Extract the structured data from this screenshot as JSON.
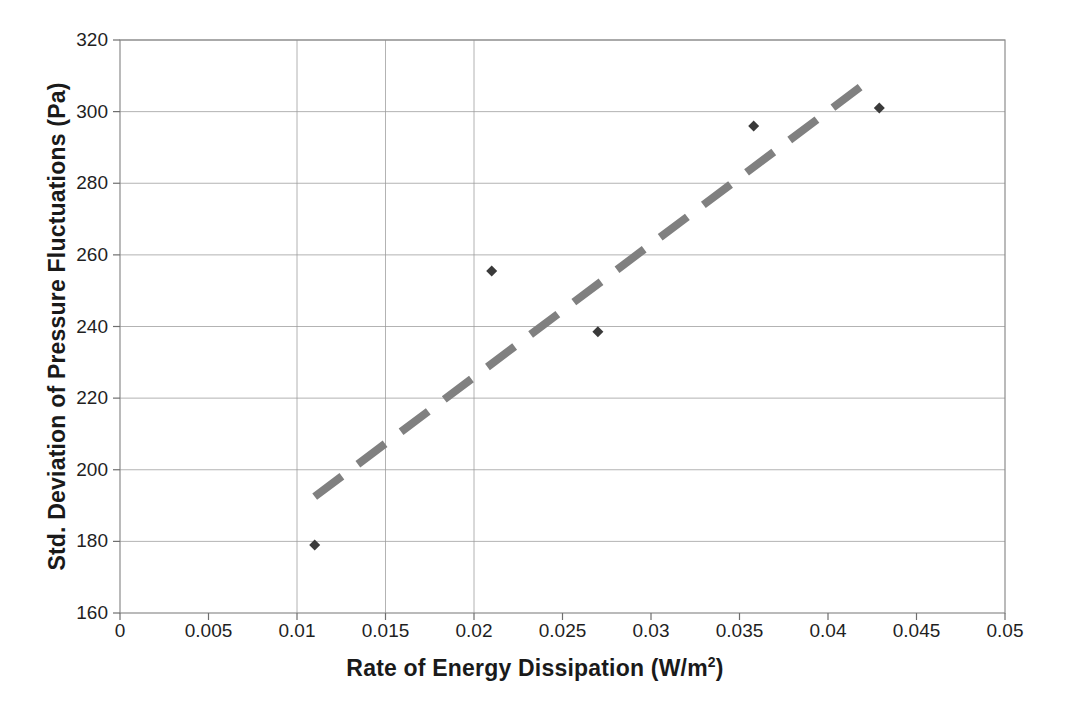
{
  "chart_data": {
    "type": "scatter",
    "title": "",
    "xlabel": "Rate of Energy Dissipation (W/m2)",
    "xlabel_base": "Rate of Energy Dissipation (W/m",
    "xlabel_sup": "2",
    "xlabel_tail": ")",
    "ylabel": "Std. Deviation of Pressure Fluctuations (Pa)",
    "xlim": [
      0,
      0.05
    ],
    "ylim": [
      160,
      320
    ],
    "xticks": [
      0,
      0.005,
      0.01,
      0.015,
      0.02,
      0.025,
      0.03,
      0.035,
      0.04,
      0.045,
      0.05
    ],
    "xtick_labels": [
      "0",
      "0.005",
      "0.01",
      "0.015",
      "0.02",
      "0.025",
      "0.03",
      "0.035",
      "0.04",
      "0.045",
      "0.05"
    ],
    "yticks": [
      160,
      180,
      200,
      220,
      240,
      260,
      280,
      300,
      320
    ],
    "ytick_labels": [
      "160",
      "180",
      "200",
      "220",
      "240",
      "260",
      "280",
      "300",
      "320"
    ],
    "grid": {
      "horizontal": true,
      "vertical_partial": [
        0.01,
        0.015,
        0.02
      ],
      "color": "#9a9a9a"
    },
    "legend": "none",
    "series": [
      {
        "name": "Measured data",
        "marker": "diamond",
        "color": "#3a3a3a",
        "points": [
          {
            "x": 0.011,
            "y": 179.0
          },
          {
            "x": 0.021,
            "y": 255.5
          },
          {
            "x": 0.027,
            "y": 238.5
          },
          {
            "x": 0.0358,
            "y": 296.0
          },
          {
            "x": 0.0429,
            "y": 301.0
          }
        ]
      },
      {
        "name": "Trend line",
        "type": "line",
        "style": "dashed",
        "color": "#808080",
        "endpoints": [
          {
            "x": 0.011,
            "y": 192.5
          },
          {
            "x": 0.0424,
            "y": 309.0
          }
        ]
      }
    ]
  },
  "axes": {
    "frame_color": "#8c8c8c",
    "background": "#ffffff"
  }
}
